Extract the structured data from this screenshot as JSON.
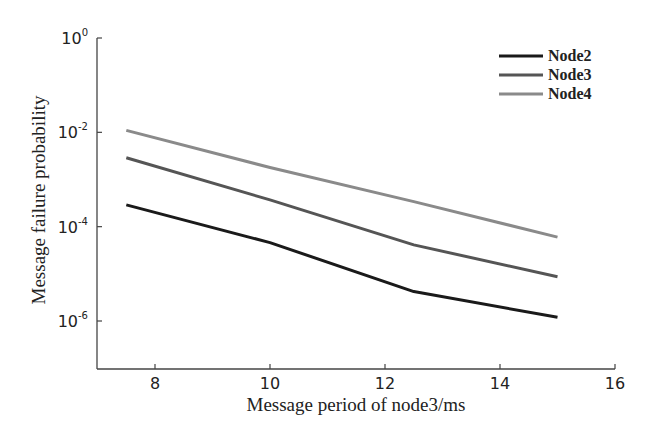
{
  "chart_data": {
    "type": "line",
    "title": "",
    "xlabel": "Message period of node3/ms",
    "ylabel": "Message failure probability",
    "xlim": [
      7,
      16
    ],
    "ylim_log10": [
      -7,
      0
    ],
    "yscale": "log",
    "grid": false,
    "legend_position": "upper right",
    "x_ticks": [
      8,
      10,
      12,
      14,
      16
    ],
    "y_ticks": [
      {
        "exp": 0,
        "label": "10",
        "sup": "0"
      },
      {
        "exp": -2,
        "label": "10",
        "sup": "-2"
      },
      {
        "exp": -4,
        "label": "10",
        "sup": "-4"
      },
      {
        "exp": -6,
        "label": "10",
        "sup": "-6"
      }
    ],
    "x": [
      7.5,
      10,
      12.5,
      15
    ],
    "series": [
      {
        "name": "Node2",
        "color": "#1a1a1a",
        "values": [
          0.00029,
          4.6e-05,
          4.2e-06,
          1.2e-06
        ]
      },
      {
        "name": "Node3",
        "color": "#555555",
        "values": [
          0.0029,
          0.00037,
          4.1e-05,
          8.7e-06
        ]
      },
      {
        "name": "Node4",
        "color": "#8a8a8a",
        "values": [
          0.011,
          0.0018,
          0.00034,
          6e-05
        ]
      }
    ]
  }
}
